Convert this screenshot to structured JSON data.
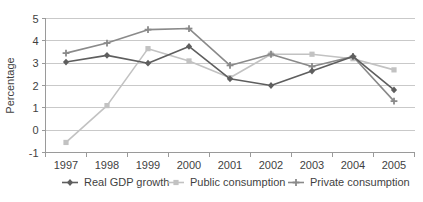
{
  "chart_data": {
    "type": "line",
    "title": "",
    "xlabel": "",
    "ylabel": "Percentage",
    "categories": [
      "1997",
      "1998",
      "1999",
      "2000",
      "2001",
      "2002",
      "2003",
      "2004",
      "2005"
    ],
    "x": [
      1997,
      1998,
      1999,
      2000,
      2001,
      2002,
      2003,
      2004,
      2005
    ],
    "ylim": [
      -1,
      5
    ],
    "yticks": [
      -1,
      0,
      1,
      2,
      3,
      4,
      5
    ],
    "ytick_labels": [
      "-1",
      "0",
      "1",
      "2",
      "3",
      "4",
      "5"
    ],
    "grid": true,
    "legend_position": "bottom",
    "series": [
      {
        "name": "Real GDP growth",
        "color": "#5e5e5e",
        "marker": "diamond",
        "values": [
          3.05,
          3.35,
          3.0,
          3.75,
          2.3,
          2.0,
          2.65,
          3.3,
          1.8
        ]
      },
      {
        "name": "Public consumption",
        "color": "#c2c2c2",
        "marker": "square",
        "values": [
          -0.55,
          1.1,
          3.65,
          3.1,
          2.35,
          3.4,
          3.4,
          3.2,
          2.7
        ]
      },
      {
        "name": "Private consumption",
        "color": "#8a8a8a",
        "marker": "cross",
        "values": [
          3.45,
          3.9,
          4.5,
          4.55,
          2.9,
          3.4,
          2.85,
          3.3,
          1.3
        ]
      }
    ]
  },
  "legend": {
    "items": [
      {
        "label": "Real GDP growth",
        "color": "#5e5e5e"
      },
      {
        "label": "Public consumption",
        "color": "#c2c2c2"
      },
      {
        "label": "Private consumption",
        "color": "#8a8a8a"
      }
    ]
  },
  "axes": {
    "y_title": "Percentage"
  }
}
